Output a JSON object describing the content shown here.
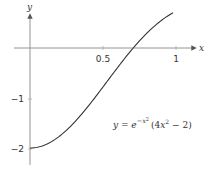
{
  "chart_data": {
    "type": "line",
    "title": "",
    "xlabel": "x",
    "ylabel": "y",
    "xlim": [
      -0.1,
      1.2
    ],
    "ylim": [
      -2.2,
      0.85
    ],
    "x_ticks": [
      {
        "value": 0.5,
        "label": "0.5"
      },
      {
        "value": 1,
        "label": "1"
      }
    ],
    "y_ticks": [
      {
        "value": -1,
        "label": "−1"
      },
      {
        "value": -2,
        "label": "−2"
      }
    ],
    "grid": false,
    "series": [
      {
        "name": "y = e^{-x^2}(4x^2 - 2)",
        "color": "#333333",
        "x": [
          0,
          0.1,
          0.2,
          0.3,
          0.4,
          0.5,
          0.6,
          0.7,
          0.8,
          0.9,
          1.0
        ],
        "y": [
          -2.0,
          -1.94,
          -1.77,
          -1.51,
          -1.17,
          -0.78,
          -0.39,
          -0.02,
          0.29,
          0.53,
          0.74
        ]
      }
    ],
    "annotation": {
      "base": "y = e",
      "exponent": "−x²",
      "tail": "(4x² − 2)"
    }
  },
  "labels": {
    "x_axis": "x",
    "y_axis": "y",
    "tick_x_half": "0.5",
    "tick_x_one": "1",
    "tick_y_neg1": "−1",
    "tick_y_neg2": "−2",
    "eq_lhs": "y",
    "eq_eq": " = ",
    "eq_e": "e",
    "eq_exp": "−x",
    "eq_exp_pow": "2",
    "eq_paren_open": "(4",
    "eq_x": "x",
    "eq_pow": "2",
    "eq_rest": " − 2)"
  }
}
